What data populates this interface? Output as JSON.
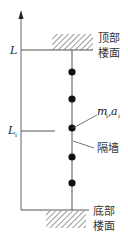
{
  "diagram": {
    "type": "structural-schematic",
    "axis": {
      "top_label": "L",
      "mid_label": "L",
      "mid_label_sub": "i"
    },
    "labels": {
      "top_floor_line1": "顶部",
      "top_floor_line2": "楼面",
      "bottom_floor_line1": "底部",
      "bottom_floor_line2": "楼面",
      "wall": "隔墙",
      "mass_m": "m",
      "mass_m_sub": "i",
      "mass_sep": ",",
      "mass_a": "a",
      "mass_a_sub": "i"
    },
    "masses": {
      "count": 5,
      "y_positions": [
        72,
        99,
        128,
        157,
        183
      ]
    },
    "colors": {
      "line": "#555555",
      "dot": "#111111",
      "hatch": "#555555",
      "text": "#333333"
    }
  }
}
